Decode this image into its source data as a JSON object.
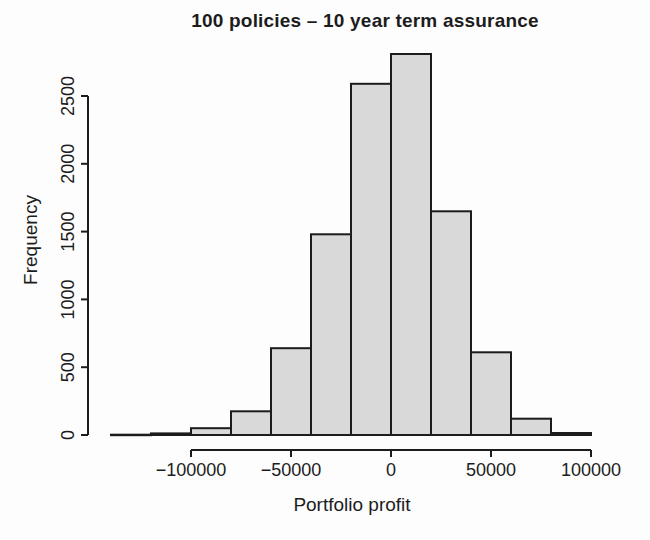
{
  "chart_data": {
    "type": "bar",
    "subtype": "histogram",
    "title": "100 policies – 10 year term assurance",
    "xlabel": "Portfolio profit",
    "ylabel": "Frequency",
    "bin_width": 20000,
    "bin_edges": [
      -140000,
      -120000,
      -100000,
      -80000,
      -60000,
      -40000,
      -20000,
      0,
      20000,
      40000,
      60000,
      80000,
      100000
    ],
    "counts": [
      2,
      12,
      50,
      175,
      640,
      1480,
      2590,
      2810,
      1650,
      610,
      120,
      15
    ],
    "x_ticks": {
      "values": [
        -100000,
        -50000,
        0,
        50000,
        100000
      ],
      "labels": [
        "−100000",
        "−50000",
        "0",
        "50000",
        "100000"
      ]
    },
    "y_ticks": {
      "values": [
        0,
        500,
        1000,
        1500,
        2000,
        2500
      ],
      "labels": [
        "0",
        "500",
        "1000",
        "1500",
        "2000",
        "2500"
      ]
    },
    "xlim": [
      -140000,
      100000
    ],
    "ylim": [
      0,
      2810
    ],
    "grid": false,
    "legend": "none",
    "colors": {
      "bar_fill": "#d9d9d9",
      "bar_stroke": "#1c1c1c",
      "axis": "#1c1c1c",
      "background": "#fdfdfd"
    }
  }
}
